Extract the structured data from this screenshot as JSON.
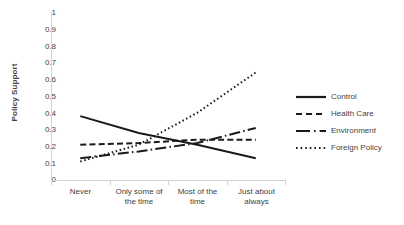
{
  "chart_data": {
    "type": "line",
    "title": "",
    "xlabel": "",
    "ylabel": "Policy Support",
    "ylim": [
      0,
      1
    ],
    "ytick_step": 0.1,
    "grid": false,
    "legend_position": "right",
    "categories": [
      "Never",
      "Only some of\nthe time",
      "Most of the\ntime",
      "Just about\nalways"
    ],
    "category_labels": [
      {
        "line1": "Never",
        "line2": ""
      },
      {
        "line1": "Only some of",
        "line2": "the time"
      },
      {
        "line1": "Most of the",
        "line2": "time"
      },
      {
        "line1": "Just about",
        "line2": "always"
      }
    ],
    "ytick_labels": [
      "1",
      "0.9",
      "0.8",
      "0.7",
      "0.6",
      "0.5",
      "0.4",
      "0.3",
      "0.2",
      "0.1",
      "0"
    ],
    "ytick_values": [
      1,
      0.9,
      0.8,
      0.7,
      0.6,
      0.5,
      0.4,
      0.3,
      0.2,
      0.1,
      0
    ],
    "series": [
      {
        "name": "Control",
        "style": "solid",
        "color": "#1a1a1a",
        "values": [
          0.38,
          0.28,
          0.21,
          0.13
        ]
      },
      {
        "name": "Health Care",
        "style": "dashed",
        "color": "#1a1a1a",
        "values": [
          0.21,
          0.22,
          0.24,
          0.24
        ]
      },
      {
        "name": "Environment",
        "style": "dash-dot",
        "color": "#1a1a1a",
        "values": [
          0.13,
          0.17,
          0.22,
          0.31
        ]
      },
      {
        "name": "Foreign Policy",
        "style": "dotted",
        "color": "#1a1a1a",
        "values": [
          0.11,
          0.21,
          0.4,
          0.64
        ]
      }
    ]
  },
  "axis": {
    "y_title": "Policy Support",
    "y_labels": [
      "1",
      "0.9",
      "0.8",
      "0.7",
      "0.6",
      "0.5",
      "0.4",
      "0.3",
      "0.2",
      "0.1",
      "0"
    ],
    "x_labels": [
      {
        "l1": "Never",
        "l2": ""
      },
      {
        "l1": "Only some of",
        "l2": "the time"
      },
      {
        "l1": "Most of the",
        "l2": "time"
      },
      {
        "l1": "Just about",
        "l2": "always"
      }
    ]
  },
  "legend": {
    "items": [
      {
        "label": "Control"
      },
      {
        "label": "Health Care"
      },
      {
        "label": "Environment"
      },
      {
        "label": "Foreign Policy"
      }
    ]
  },
  "colors": {
    "line": "#1a1a1a",
    "axis": "#d2d2d2",
    "text": "#3f3f3f",
    "background": "#ffffff"
  }
}
